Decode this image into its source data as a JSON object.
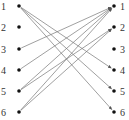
{
  "diagram": {
    "type": "bipartite-mapping",
    "left_nodes": [
      {
        "label": "1",
        "x": 19,
        "y": 6
      },
      {
        "label": "2",
        "x": 19,
        "y": 27
      },
      {
        "label": "3",
        "x": 19,
        "y": 49
      },
      {
        "label": "4",
        "x": 19,
        "y": 70
      },
      {
        "label": "5",
        "x": 19,
        "y": 91
      },
      {
        "label": "6",
        "x": 19,
        "y": 112
      }
    ],
    "right_nodes": [
      {
        "label": "1",
        "x": 114,
        "y": 6
      },
      {
        "label": "2",
        "x": 114,
        "y": 27
      },
      {
        "label": "3",
        "x": 114,
        "y": 49
      },
      {
        "label": "4",
        "x": 114,
        "y": 70
      },
      {
        "label": "5",
        "x": 114,
        "y": 91
      },
      {
        "label": "6",
        "x": 114,
        "y": 112
      }
    ],
    "edges": [
      {
        "from": "1",
        "to": "4"
      },
      {
        "from": "1",
        "to": "5"
      },
      {
        "from": "1",
        "to": "6"
      },
      {
        "from": "3",
        "to": "1"
      },
      {
        "from": "4",
        "to": "1"
      },
      {
        "from": "5",
        "to": "1"
      },
      {
        "from": "5",
        "to": "2"
      },
      {
        "from": "6",
        "to": "1"
      },
      {
        "from": "6",
        "to": "2"
      }
    ],
    "colors": {
      "node": "#111111",
      "edge": "#777777",
      "label": "#333333"
    }
  }
}
